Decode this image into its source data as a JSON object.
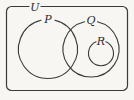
{
  "figure": {
    "name": "venn-diagram",
    "width": 134,
    "height": 100,
    "background_color": "#f7f6f3",
    "stroke_color": "#3a3a3a"
  },
  "labels": {
    "universe": "U",
    "set_p": "P",
    "set_q": "Q",
    "set_r": "R"
  },
  "shapes": {
    "universe_rect": {
      "x": 6.5,
      "y": 6.5,
      "width": 121,
      "height": 84,
      "corner_radius": 5,
      "label_gap_start": 29,
      "label_gap_end": 41
    },
    "circle_p": {
      "cx": 48,
      "cy": 48.5,
      "r": 29.5,
      "label_gap_degrees": 26
    },
    "circle_q": {
      "cx": 91,
      "cy": 49,
      "r": 28,
      "label_gap_degrees": 24
    },
    "circle_r": {
      "cx": 101,
      "cy": 53.5,
      "r": 12.5,
      "label_gap_degrees": 46
    }
  },
  "label_positions": {
    "universe": {
      "x": 35,
      "y": 6
    },
    "set_p": {
      "x": 47,
      "y": 19
    },
    "set_q": {
      "x": 86,
      "y": 19
    },
    "set_r": {
      "x": 99,
      "y": 41
    }
  }
}
